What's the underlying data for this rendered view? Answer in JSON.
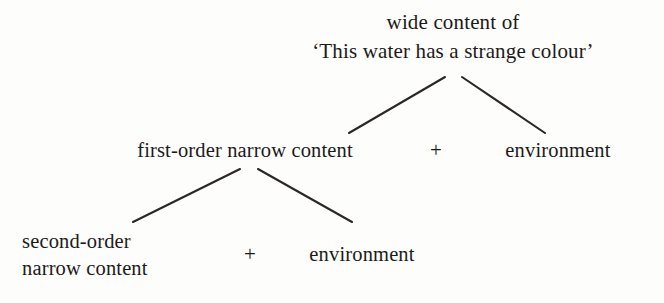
{
  "figure": {
    "kind": "tree-diagram",
    "background_color": "#fdfdfc",
    "ink_color": "#1c1a19",
    "width": 664,
    "height": 303
  },
  "nodes": {
    "root": {
      "line1": "wide content of",
      "line2": "‘This water has a strange colour’"
    },
    "first_order": "first-order narrow content",
    "environment_middle": "environment",
    "second_order": {
      "line1": "second-order",
      "line2": "narrow content"
    },
    "environment_bottom": "environment"
  },
  "operators": {
    "plus_middle": "+",
    "plus_bottom": "+"
  },
  "edges": [
    {
      "name": "root-to-first-order",
      "x1": 445,
      "y1": 77,
      "x2": 349,
      "y2": 133
    },
    {
      "name": "root-to-environment",
      "x1": 462,
      "y1": 77,
      "x2": 545,
      "y2": 133
    },
    {
      "name": "first-order-to-second-order",
      "x1": 240,
      "y1": 169,
      "x2": 133,
      "y2": 222
    },
    {
      "name": "first-order-to-environment",
      "x1": 258,
      "y1": 169,
      "x2": 352,
      "y2": 222
    }
  ]
}
